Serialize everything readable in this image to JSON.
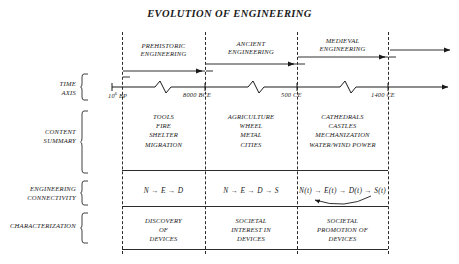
{
  "title": "EVOLUTION OF ENGINEERING",
  "row_labels": {
    "time_axis": [
      "TIME",
      "AXIS"
    ],
    "content_summary": [
      "CONTENT",
      "SUMMARY"
    ],
    "engineering_connectivity": [
      "ENGINEERING",
      "CONNECTIVITY"
    ],
    "characterization": [
      "CHARACTERIZATION"
    ]
  },
  "eras": [
    {
      "name": "prehistoric",
      "lines": [
        "PREHISTORIC",
        "ENGINEERING"
      ]
    },
    {
      "name": "ancient",
      "lines": [
        "ANCIENT",
        "ENGINEERING"
      ]
    },
    {
      "name": "medieval",
      "lines": [
        "MEDIEVAL",
        "ENGINEERING"
      ]
    }
  ],
  "time_axis": {
    "ticks": [
      {
        "label": "10",
        "exponent": "6",
        "suffix": " BP"
      },
      {
        "label": "8000 BCE",
        "exponent": "",
        "suffix": ""
      },
      {
        "label": "500 CE",
        "exponent": "",
        "suffix": ""
      },
      {
        "label": "1400 CE",
        "exponent": "",
        "suffix": ""
      }
    ]
  },
  "content_summary": [
    [
      "TOOLS",
      "FIRE",
      "SHELTER",
      "MIGRATION"
    ],
    [
      "AGRICULTURE",
      "WHEEL",
      "METAL",
      "CITIES"
    ],
    [
      "CATHEDRALS",
      "CASTLES",
      "MECHANIZATION",
      "WATER/WIND POWER"
    ]
  ],
  "engineering_connectivity": [
    {
      "text": "N → E → D",
      "feedback": false
    },
    {
      "text": "N → E → D → S",
      "feedback": false
    },
    {
      "text": "N(t) → E(t) → D(t) → S(t)",
      "feedback": true
    }
  ],
  "characterization": [
    [
      "DISCOVERY",
      "OF",
      "DEVICES"
    ],
    [
      "SOCIETAL",
      "INTEREST IN",
      "DEVICES"
    ],
    [
      "SOCIETAL",
      "PROMOTION OF",
      "DEVICES"
    ]
  ],
  "colors": {
    "ink": "#1a1a1a",
    "line": "#2b2b2b",
    "background": "#ffffff"
  }
}
